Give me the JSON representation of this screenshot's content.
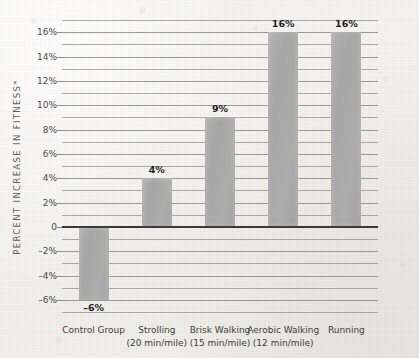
{
  "chart_data": {
    "type": "bar",
    "title": "",
    "xlabel": "",
    "ylabel": "PERCENT INCREASE IN FITNESS*",
    "categories": [
      "Control Group",
      "Strolling",
      "Brisk Walking",
      "Aerobic Walking",
      "Running"
    ],
    "category_sublabels": [
      "",
      "(20 min/mile)",
      "(15 min/mile)",
      "(12 min/mile)",
      ""
    ],
    "values": [
      -6,
      4,
      9,
      16,
      16
    ],
    "value_labels": [
      "–6%",
      "4%",
      "9%",
      "16%",
      "16%"
    ],
    "ylim": [
      -7,
      17
    ],
    "ytick_values": [
      16,
      14,
      12,
      10,
      8,
      6,
      4,
      2,
      0,
      -2,
      -4,
      -6
    ],
    "ytick_labels": [
      "16%",
      "14%",
      "12%",
      "10%",
      "8%",
      "6%",
      "4%",
      "2%",
      "0",
      "–2%",
      "–4%",
      "–6%"
    ],
    "gridline_step": 1,
    "grid": true,
    "legend": "none",
    "zero_line": 0,
    "bar_color": "#a8a8a8",
    "grid_color": "#9b9b9b",
    "zero_line_color": "#3a3a3a",
    "background_color": "#f2f1ed",
    "text_color": "#3d3d3d"
  }
}
